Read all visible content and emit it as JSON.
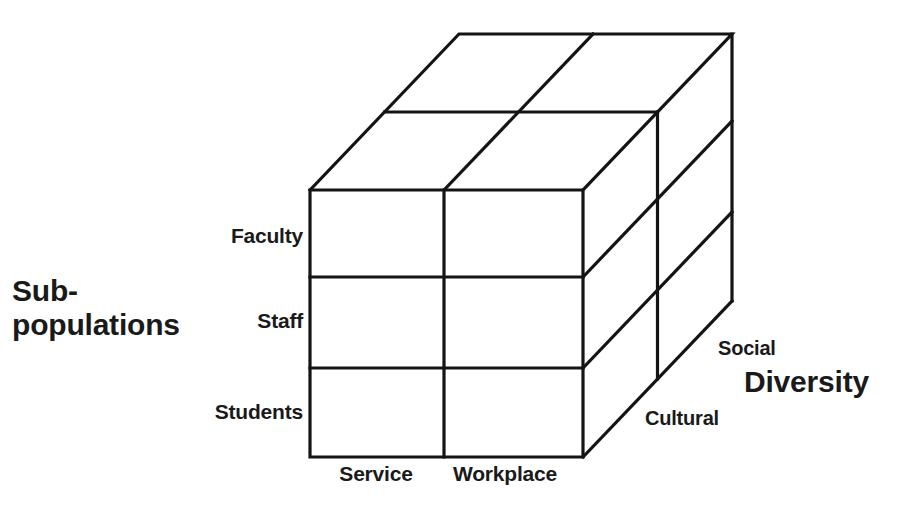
{
  "diagram": {
    "type": "3d-cube-matrix",
    "background_color": "#ffffff",
    "line_color": "#141414",
    "axes": [
      {
        "name": "Sub-populations",
        "title": "Sub-\npopulations",
        "title_line1": "Sub-",
        "title_line2": "populations",
        "orientation": "vertical",
        "categories": [
          "Faculty",
          "Staff",
          "Students"
        ]
      },
      {
        "name": "Focus",
        "title": "",
        "orientation": "horizontal",
        "categories": [
          "Service",
          "Workplace"
        ]
      },
      {
        "name": "Diversity",
        "title": "Diversity",
        "orientation": "depth",
        "categories": [
          "Social",
          "Cultural"
        ]
      }
    ],
    "labels": {
      "subpopulations_line1": "Sub-",
      "subpopulations_line2": "populations",
      "faculty": "Faculty",
      "staff": "Staff",
      "students": "Students",
      "service": "Service",
      "workplace": "Workplace",
      "social": "Social",
      "cultural": "Cultural",
      "diversity": "Diversity"
    },
    "grid": {
      "rows": 3,
      "columns": 2,
      "depth_slices": 2
    }
  }
}
